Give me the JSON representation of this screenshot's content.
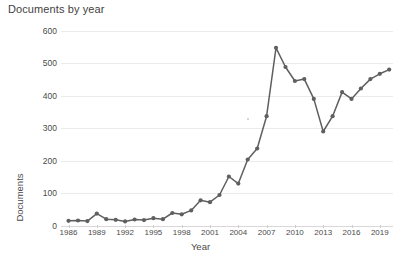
{
  "chart_data": {
    "type": "line",
    "title": "Documents by year",
    "xlabel": "Year",
    "ylabel": "Documents",
    "xlim": [
      1985.2,
      2020.4
    ],
    "ylim": [
      0,
      620
    ],
    "yticks": [
      0,
      100,
      200,
      300,
      400,
      500,
      600
    ],
    "xticks": [
      1986,
      1989,
      1992,
      1995,
      1998,
      2001,
      2004,
      2007,
      2010,
      2013,
      2016,
      2019
    ],
    "grid": true,
    "legend": false,
    "marker": "circle",
    "line_color": "#5f5f5f",
    "marker_color": "#5f5f5f",
    "grid_color": "#eceaea",
    "x": [
      1986,
      1987,
      1988,
      1989,
      1990,
      1991,
      1992,
      1993,
      1994,
      1995,
      1996,
      1997,
      1998,
      1999,
      2000,
      2001,
      2002,
      2003,
      2004,
      2005,
      2006,
      2007,
      2008,
      2009,
      2010,
      2011,
      2012,
      2013,
      2014,
      2015,
      2016,
      2017,
      2018,
      2019,
      2020
    ],
    "values": [
      16,
      17,
      15,
      38,
      21,
      19,
      14,
      20,
      18,
      24,
      21,
      40,
      36,
      48,
      79,
      73,
      95,
      152,
      130,
      204,
      238,
      337,
      547,
      488,
      445,
      451,
      390,
      290,
      337,
      411,
      390,
      422,
      451,
      467,
      480
    ],
    "series": [
      {
        "name": "Documents",
        "values": [
          16,
          17,
          15,
          38,
          21,
          19,
          14,
          20,
          18,
          24,
          21,
          40,
          36,
          48,
          79,
          73,
          95,
          152,
          130,
          204,
          238,
          337,
          547,
          488,
          445,
          451,
          390,
          290,
          337,
          411,
          390,
          422,
          451,
          467,
          480
        ]
      }
    ],
    "annotations": {
      "peak_year": 2008,
      "peak_value": 547,
      "min_recent_year": 2013,
      "min_recent_value": 290
    }
  }
}
